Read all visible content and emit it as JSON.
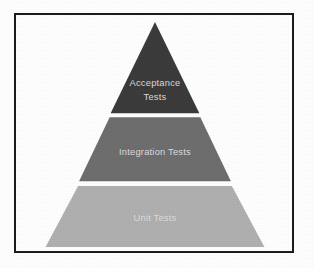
{
  "diagram": {
    "type": "test-pyramid",
    "frame": {
      "border_color": "#1c1c1c",
      "background_color": "#ffffff"
    },
    "label_color": "#dcdcdc",
    "tiers": [
      {
        "id": "acceptance",
        "level": 1,
        "position": "top",
        "shape": "triangle",
        "label": "Acceptance Tests",
        "label_lines": [
          "Acceptance",
          "Tests"
        ],
        "color": "#3b3b3b"
      },
      {
        "id": "integration",
        "level": 2,
        "position": "middle",
        "shape": "trapezoid",
        "label": "Integration Tests",
        "label_lines": [
          "Integration Tests"
        ],
        "color": "#6e6e6e"
      },
      {
        "id": "unit",
        "level": 3,
        "position": "bottom",
        "shape": "trapezoid",
        "label": "Unit Tests",
        "label_lines": [
          "Unit Tests"
        ],
        "color": "#b0b0b0"
      }
    ]
  }
}
